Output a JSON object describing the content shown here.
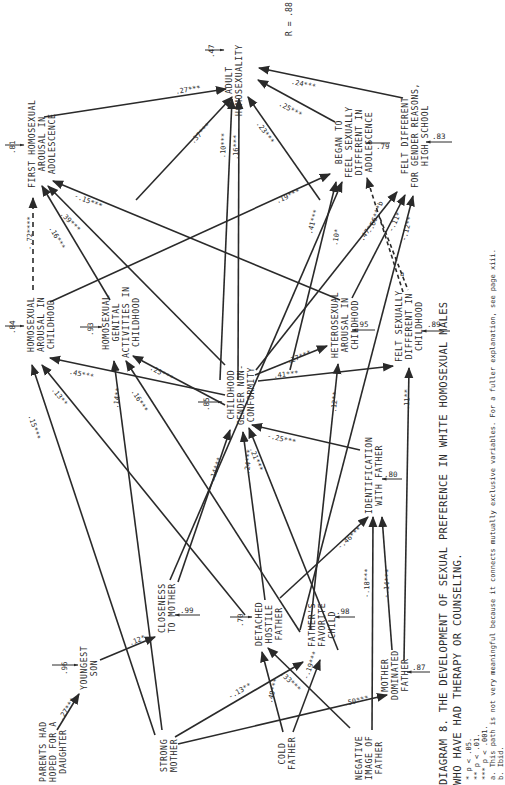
{
  "diagram": {
    "title_line1": "DIAGRAM 8.  THE DEVELOPMENT OF SEXUAL PREFERENCE IN WHITE HOMOSEXUAL MALES",
    "title_line2": "WHO HAVE HAD THERAPY OR COUNSELING.",
    "r_value": "R = .88",
    "footnotes": [
      "*  p < .05.",
      "**  p < .01.",
      "***  p < .001.",
      "a.  This path is not very meaningful because it connects mutually exclusive variables.  For a fuller explanation, see page xiii.",
      "b.  Ibid."
    ],
    "orientation": "rotated 90° counter-clockwise"
  },
  "nodes": {
    "adult_homosexuality": {
      "label": "ADULT\nHOMOSEXUALITY",
      "residual": ".47"
    },
    "first_homosexual_arousal_adolescence": {
      "label": "FIRST HOMOSEXUAL\nAROUSAL IN\nADOLESCENCE",
      "residual": ".81"
    },
    "began_to_feel_sexually_different": {
      "label": "BEGAN TO\nFEEL SEXUALLY\nDIFFERENT IN\nADOLESCENCE",
      "residual": ".79"
    },
    "felt_different_gender_reasons": {
      "label": "FELT DIFFERENT\nFOR GENDER REASONS,\nHIGH SCHOOL",
      "residual": ".83"
    },
    "homosexual_arousal_childhood": {
      "label": "HOMOSEXUAL\nAROUSAL IN\nCHILDHOOD",
      "residual": ".84"
    },
    "homosexual_genital_activities_childhood": {
      "label": "HOMOSEXUAL\nGENITAL\nACTIVITIES IN\nCHILDHOOD",
      "residual": ".93"
    },
    "childhood_gender_nonconformity": {
      "label": "CHILDHOOD\nGENDER NON-\nCONFORMITY",
      "residual": ".85"
    },
    "heterosexual_arousal_childhood": {
      "label": "HETEROSEXUAL\nAROUSAL IN\nCHILDHOOD",
      "residual": ".95"
    },
    "felt_sexually_different_childhood": {
      "label": "FELT SEXUALLY\nDIFFERENT IN\nCHILDHOOD",
      "residual": ".89"
    },
    "identification_with_father": {
      "label": "IDENTIFICATION\nWITH FATHER",
      "residual": ".80"
    },
    "closeness_to_mother": {
      "label": "CLOSENESS\nTO MOTHER",
      "residual": ".99"
    },
    "detached_hostile_father": {
      "label": "DETACHED\nHOSTILE\nFATHER",
      "residual": ".70"
    },
    "fathers_favorite_child": {
      "label": "FATHER'S\nFAVORITE\nCHILD",
      "residual": ".98"
    },
    "mother_dominated_father": {
      "label": "MOTHER\nDOMINATED\nFATHER",
      "residual": ".87"
    },
    "youngest_son": {
      "label": "YOUNGEST\nSON",
      "residual": ".96"
    },
    "parents_hoped_daughter": {
      "label": "PARENTS HAD\nHOPED FOR A\nDAUGHTER"
    },
    "strong_mother": {
      "label": "STRONG\nMOTHER"
    },
    "cold_father": {
      "label": "COLD\nFATHER"
    },
    "negative_image_father": {
      "label": "NEGATIVE\nIMAGE OF\nFATHER"
    }
  },
  "paths": [
    {
      "from": "first_homosexual_arousal_adolescence",
      "to": "adult_homosexuality",
      "coef": ".27***"
    },
    {
      "from": "childhood_gender_nonconformity",
      "to": "adult_homosexuality",
      "coef": ".37***"
    },
    {
      "from": "heterosexual_arousal_childhood",
      "to": "adult_homosexuality",
      "coef": ".10***"
    },
    {
      "from": "felt_sexually_different_childhood",
      "to": "adult_homosexuality",
      "coef": ".16***"
    },
    {
      "from": "identification_with_father",
      "to": "adult_homosexuality",
      "coef": ".23***"
    },
    {
      "from": "began_to_feel_sexually_different",
      "to": "adult_homosexuality",
      "coef": ".25***"
    },
    {
      "from": "felt_different_gender_reasons",
      "to": "adult_homosexuality",
      "coef": ".24***"
    },
    {
      "from": "homosexual_arousal_childhood",
      "to": "first_homosexual_arousal_adolescence",
      "coef": "-.72****",
      "style": "dashed"
    },
    {
      "from": "homosexual_genital_activities_childhood",
      "to": "first_homosexual_arousal_adolescence",
      "coef": ".16***"
    },
    {
      "from": "childhood_gender_nonconformity",
      "to": "first_homosexual_arousal_adolescence",
      "coef": ".39***"
    },
    {
      "from": "heterosexual_arousal_childhood",
      "to": "first_homosexual_arousal_adolescence",
      "coef": "-.15***"
    },
    {
      "from": "homosexual_arousal_childhood",
      "to": "began_to_feel_sexually_different",
      "coef": ".19***"
    },
    {
      "from": "childhood_gender_nonconformity",
      "to": "began_to_feel_sexually_different",
      "coef": ".41***"
    },
    {
      "from": "closeness_to_mother",
      "to": "began_to_feel_sexually_different",
      "coef": ".10*"
    },
    {
      "from": "felt_sexually_different_childhood",
      "to": "began_to_feel_sexually_different",
      "coef": "-.66***b",
      "style": "dashed"
    },
    {
      "from": "childhood_gender_nonconformity",
      "to": "felt_different_gender_reasons",
      "coef": ".47***"
    },
    {
      "from": "heterosexual_arousal_childhood",
      "to": "felt_different_gender_reasons",
      "coef": "-.11*"
    },
    {
      "from": "fathers_favorite_child",
      "to": "felt_different_gender_reasons",
      "coef": "-.12**"
    },
    {
      "from": "felt_sexually_different_childhood",
      "to": "felt_different_gender_reasons",
      "coef": "a",
      "style": "dashed"
    },
    {
      "from": "childhood_gender_nonconformity",
      "to": "homosexual_arousal_childhood",
      "coef": ".45***"
    },
    {
      "from": "strong_mother",
      "to": "homosexual_arousal_childhood",
      "coef": ".15***"
    },
    {
      "from": "detached_hostile_father",
      "to": "homosexual_arousal_childhood",
      "coef": ".13**"
    },
    {
      "from": "childhood_gender_nonconformity",
      "to": "homosexual_genital_activities_childhood",
      "coef": ".25***"
    },
    {
      "from": "strong_mother",
      "to": "homosexual_genital_activities_childhood",
      "coef": ".14**"
    },
    {
      "from": "fathers_favorite_child",
      "to": "homosexual_genital_activities_childhood",
      "coef": ".16***"
    },
    {
      "from": "childhood_gender_nonconformity",
      "to": "heterosexual_arousal_childhood",
      "coef": "-.27***"
    },
    {
      "from": "fathers_favorite_child",
      "to": "heterosexual_arousal_childhood",
      "coef": ".12**"
    },
    {
      "from": "childhood_gender_nonconformity",
      "to": "felt_sexually_different_childhood",
      "coef": ".41***"
    },
    {
      "from": "mother_dominated_father",
      "to": "felt_sexually_different_childhood",
      "coef": ".11**"
    },
    {
      "from": "closeness_to_mother",
      "to": "childhood_gender_nonconformity",
      "coef": ".14***"
    },
    {
      "from": "detached_hostile_father",
      "to": "childhood_gender_nonconformity",
      "coef": ".24***"
    },
    {
      "from": "negative_image_father",
      "to": "childhood_gender_nonconformity",
      "coef": ".21***"
    },
    {
      "from": "identification_with_father",
      "to": "childhood_gender_nonconformity",
      "coef": "-.25***"
    },
    {
      "from": "detached_hostile_father",
      "to": "identification_with_father",
      "coef": "-.46***"
    },
    {
      "from": "negative_image_father",
      "to": "identification_with_father",
      "coef": "-.18***"
    },
    {
      "from": "mother_dominated_father",
      "to": "identification_with_father",
      "coef": "-.14***"
    },
    {
      "from": "youngest_son",
      "to": "closeness_to_mother",
      "coef": ".12*"
    },
    {
      "from": "parents_hoped_daughter",
      "to": "youngest_son",
      "coef": ".27***"
    },
    {
      "from": "strong_mother",
      "to": "fathers_favorite_child",
      "coef": "-.13**"
    },
    {
      "from": "strong_mother",
      "to": "mother_dominated_father",
      "coef": ".50***"
    },
    {
      "from": "cold_father",
      "to": "detached_hostile_father",
      "coef": ".49***"
    },
    {
      "from": "cold_father",
      "to": "fathers_favorite_child",
      "coef": "-.19***"
    },
    {
      "from": "negative_image_father",
      "to": "detached_hostile_father",
      "coef": ".33***"
    }
  ]
}
